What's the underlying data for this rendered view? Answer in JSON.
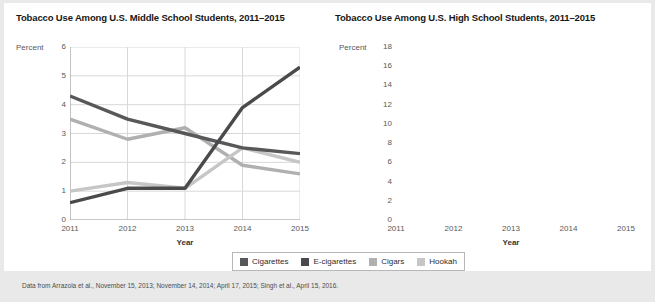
{
  "footnote": "Data from Arrazola et al., November 15, 2013; November 14, 2014; April 17, 2015; Singh et al., April 15, 2016.",
  "legend": {
    "items": [
      {
        "label": "Cigarettes",
        "color": "#58585a"
      },
      {
        "label": "E-cigarettes",
        "color": "#4a4a4c"
      },
      {
        "label": "Cigars",
        "color": "#b0b0b0"
      },
      {
        "label": "Hookah",
        "color": "#c6c6c6"
      }
    ]
  },
  "colors": {
    "cigarettes": "#58585a",
    "ecigarettes": "#4a4a4c",
    "cigars": "#b0b0b0",
    "hookah": "#c6c6c6",
    "grid": "#d8d8d8",
    "axis": "#a8a8a8",
    "text": "#58585a",
    "card": "#ffffff",
    "page": "#e9e9e9"
  },
  "chart_data": [
    {
      "type": "line",
      "title": "Tobacco Use Among U.S. Middle School Students, 2011–2015",
      "xlabel": "Year",
      "ylabel": "Percent",
      "categories": [
        "2011",
        "2012",
        "2013",
        "2014",
        "2015"
      ],
      "x": [
        2011,
        2012,
        2013,
        2014,
        2015
      ],
      "ylim": [
        0,
        6
      ],
      "yticks": [
        0,
        1,
        2,
        3,
        4,
        5,
        6
      ],
      "grid": true,
      "legend_position": "bottom-center-shared",
      "series": [
        {
          "name": "Cigarettes",
          "color": "#58585a",
          "values": [
            4.3,
            3.5,
            3.0,
            2.5,
            2.3
          ]
        },
        {
          "name": "E-cigarettes",
          "color": "#4a4a4c",
          "values": [
            0.6,
            1.1,
            1.1,
            3.9,
            5.3
          ]
        },
        {
          "name": "Cigars",
          "color": "#b0b0b0",
          "values": [
            3.5,
            2.8,
            3.2,
            1.9,
            1.6
          ]
        },
        {
          "name": "Hookah",
          "color": "#c6c6c6",
          "values": [
            1.0,
            1.3,
            1.1,
            2.5,
            2.0
          ]
        }
      ]
    },
    {
      "type": "line",
      "title": "Tobacco Use Among U.S. High School Students, 2011–2015",
      "xlabel": "Year",
      "ylabel": "Percent",
      "categories": [
        "2011",
        "2012",
        "2013",
        "2014",
        "2015"
      ],
      "x": [
        2011,
        2012,
        2013,
        2014,
        2015
      ],
      "ylim": [
        0,
        18
      ],
      "yticks": [
        0,
        2,
        4,
        6,
        8,
        10,
        12,
        14,
        16,
        18
      ],
      "grid": true,
      "legend_position": "bottom-center-shared",
      "series": [
        {
          "name": "Cigarettes",
          "color": "#58585a",
          "values": [
            15.8,
            14.0,
            12.7,
            9.2,
            9.3
          ]
        },
        {
          "name": "E-cigarettes",
          "color": "#4a4a4c",
          "values": [
            1.5,
            2.8,
            4.5,
            13.4,
            16.0
          ]
        },
        {
          "name": "Cigars",
          "color": "#b0b0b0",
          "values": [
            11.6,
            12.6,
            11.9,
            8.6,
            8.6
          ]
        },
        {
          "name": "Hookah",
          "color": "#c6c6c6",
          "values": [
            4.1,
            5.4,
            5.2,
            9.4,
            7.2
          ]
        }
      ]
    }
  ]
}
